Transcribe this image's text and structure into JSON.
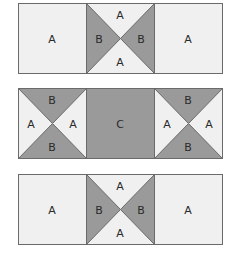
{
  "colors": {
    "light": "#f0f0f0",
    "dark": "#9a9a9a",
    "border": "#6a6a6a"
  },
  "rows": [
    {
      "blocks": [
        {
          "type": "plain",
          "label": "A"
        },
        {
          "type": "hourglass-vertical",
          "top": "A",
          "bottom": "A",
          "left": "B",
          "right": "B"
        },
        {
          "type": "plain",
          "label": "A"
        }
      ]
    },
    {
      "blocks": [
        {
          "type": "hourglass-horizontal",
          "top": "B",
          "bottom": "B",
          "left": "A",
          "right": "A"
        },
        {
          "type": "plain-dark",
          "label": "C"
        },
        {
          "type": "hourglass-horizontal",
          "top": "B",
          "bottom": "B",
          "left": "A",
          "right": "A"
        }
      ]
    },
    {
      "blocks": [
        {
          "type": "plain",
          "label": "A"
        },
        {
          "type": "hourglass-vertical",
          "top": "A",
          "bottom": "A",
          "left": "B",
          "right": "B"
        },
        {
          "type": "plain",
          "label": "A"
        }
      ]
    }
  ]
}
